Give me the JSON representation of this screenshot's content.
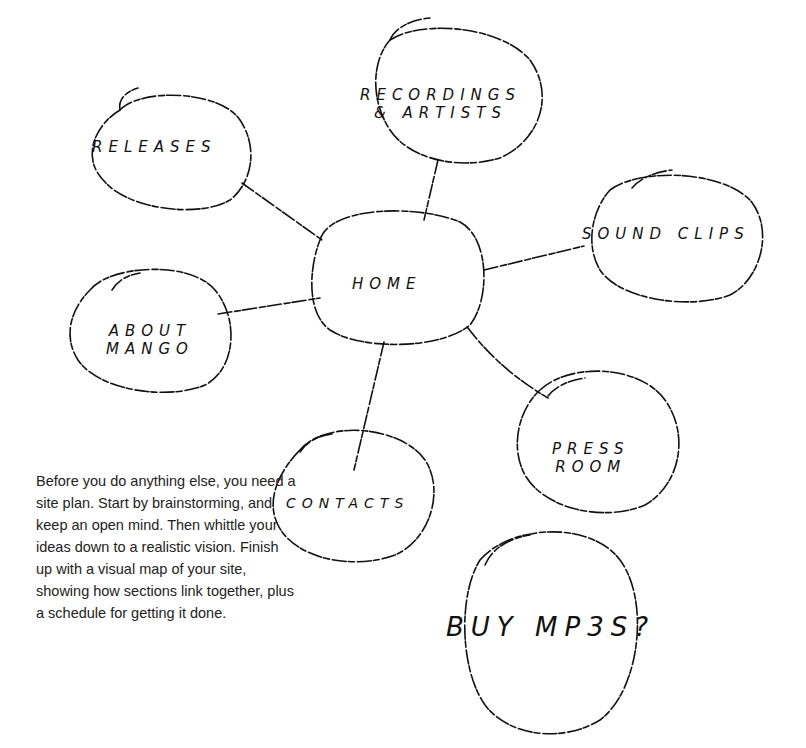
{
  "diagram": {
    "type": "site-map-sketch",
    "center": {
      "id": "home",
      "label": "HOME"
    },
    "nodes": [
      {
        "id": "releases",
        "label": "RELEASES"
      },
      {
        "id": "recordings",
        "label_line1": "RECORDINGS",
        "label_line2": "& ARTISTS"
      },
      {
        "id": "sound-clips",
        "label": "SOUND CLIPS"
      },
      {
        "id": "about",
        "label_line1": "ABOUT",
        "label_line2": "MANGO"
      },
      {
        "id": "press-room",
        "label_line1": "PRESS",
        "label_line2": "ROOM"
      },
      {
        "id": "contacts",
        "label": "CONTACTS"
      },
      {
        "id": "buy-mp3s",
        "label": "BUY MP3S?"
      }
    ],
    "edges": [
      [
        "home",
        "releases"
      ],
      [
        "home",
        "recordings"
      ],
      [
        "home",
        "sound-clips"
      ],
      [
        "home",
        "about"
      ],
      [
        "home",
        "press-room"
      ],
      [
        "home",
        "contacts"
      ]
    ],
    "stroke_color": "#111111"
  },
  "caption": {
    "text": "Before you do anything else, you need a site plan. Start by brainstorming, and keep an open mind. Then whittle your ideas down to a realistic vision. Finish up with a visual map of your site, showing how sections link together, plus a schedule for getting it done."
  }
}
